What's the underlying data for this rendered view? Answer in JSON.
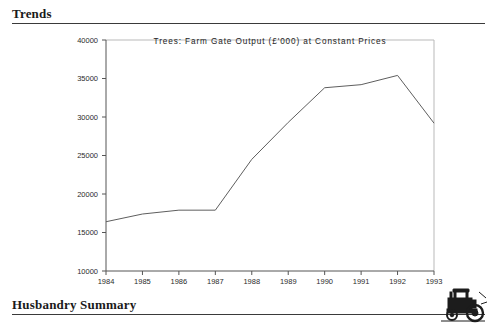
{
  "page": {
    "background_color": "#ffffff",
    "text_color": "#1a1a1a"
  },
  "sections": {
    "trends": {
      "title": "Trends"
    },
    "husbandry": {
      "title": "Husbandry Summary"
    }
  },
  "decoration": {
    "tractor_icon_name": "tractor-icon"
  },
  "chart_data": {
    "type": "line",
    "title": "Trees: Farm Gate Output (£'000) at Constant Prices",
    "xlabel": "",
    "ylabel": "",
    "grid": false,
    "legend": "none",
    "line_color": "#5e5e5e",
    "categories": [
      "1984",
      "1985",
      "1986",
      "1987",
      "1988",
      "1989",
      "1990",
      "1991",
      "1992",
      "1993"
    ],
    "x": [
      1984,
      1985,
      1986,
      1987,
      1988,
      1989,
      1990,
      1991,
      1992,
      1993
    ],
    "values": [
      16400,
      17400,
      17900,
      17900,
      24500,
      29300,
      33800,
      34200,
      35400,
      29200
    ],
    "series": [
      {
        "name": "Trees: Farm Gate Output",
        "values": [
          16400,
          17400,
          17900,
          17900,
          24500,
          29300,
          33800,
          34200,
          35400,
          29200
        ]
      }
    ],
    "ylim": [
      10000,
      40000
    ],
    "yticks": [
      10000,
      15000,
      20000,
      25000,
      30000,
      35000,
      40000
    ],
    "ytick_labels": [
      "10000",
      "15000",
      "20000",
      "25000",
      "30000",
      "35000",
      "40000"
    ],
    "xlim": [
      1984,
      1993
    ],
    "xticks": [
      1984,
      1985,
      1986,
      1987,
      1988,
      1989,
      1990,
      1991,
      1992,
      1993
    ],
    "xtick_labels": [
      "1984",
      "1985",
      "1986",
      "1987",
      "1988",
      "1989",
      "1990",
      "1991",
      "1992",
      "1993"
    ]
  }
}
